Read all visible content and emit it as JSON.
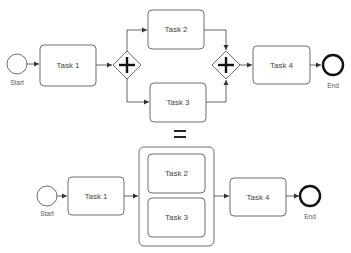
{
  "top_process": {
    "start": {
      "label": "Start"
    },
    "task1": {
      "label": "Task 1"
    },
    "split_gateway": {
      "type": "parallel",
      "symbol": "+"
    },
    "task2": {
      "label": "Task 2"
    },
    "task3": {
      "label": "Task 3"
    },
    "join_gateway": {
      "type": "parallel",
      "symbol": "+"
    },
    "task4": {
      "label": "Task 4"
    },
    "end": {
      "label": "End"
    }
  },
  "equals": {
    "symbol": "="
  },
  "bottom_process": {
    "start": {
      "label": "Start"
    },
    "task1": {
      "label": "Task 1"
    },
    "container": {
      "task2": {
        "label": "Task 2"
      },
      "task3": {
        "label": "Task 3"
      }
    },
    "task4": {
      "label": "Task 4"
    },
    "end": {
      "label": "End"
    }
  },
  "colors": {
    "stroke": "#6e6e6e",
    "text": "#444444",
    "end_stroke": "#111111"
  }
}
